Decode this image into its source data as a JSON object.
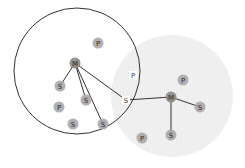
{
  "diagram": {
    "type": "network-topology",
    "colors": {
      "circle_outline": "#333333",
      "shaded_region": "#f2f2f2",
      "node_fill": "#a8a8a8",
      "master_fill": "#8a8a8a",
      "edge": "#333333"
    },
    "regions": [
      {
        "id": "left-piconet",
        "cx": 77,
        "cy": 71,
        "r": 63,
        "style": "outline"
      },
      {
        "id": "right-piconet",
        "cx": 172,
        "cy": 96,
        "r": 61,
        "style": "shaded"
      }
    ],
    "nodes": [
      {
        "id": "m1",
        "label": "M",
        "x": 75,
        "y": 63,
        "role": "master",
        "circle": true
      },
      {
        "id": "p1",
        "label": "P",
        "x": 98,
        "y": 43,
        "role": "parked",
        "circle": true
      },
      {
        "id": "s1",
        "label": "S",
        "x": 60,
        "y": 86,
        "role": "slave",
        "circle": true
      },
      {
        "id": "s2",
        "label": "S",
        "x": 86,
        "y": 100,
        "role": "slave",
        "circle": true
      },
      {
        "id": "p2",
        "label": "P",
        "x": 59,
        "y": 107,
        "role": "parked",
        "circle": true
      },
      {
        "id": "s3",
        "label": "S",
        "x": 73,
        "y": 124,
        "role": "slave",
        "circle": true
      },
      {
        "id": "s4",
        "label": "S",
        "x": 103,
        "y": 124,
        "role": "slave",
        "circle": true
      },
      {
        "id": "pb",
        "label": "P",
        "x": 133,
        "y": 75,
        "role": "parked",
        "circle": false
      },
      {
        "id": "sb",
        "label": "S",
        "x": 126,
        "y": 100,
        "role": "bridge-slave",
        "circle": false
      },
      {
        "id": "m2",
        "label": "M",
        "x": 171,
        "y": 97,
        "role": "master",
        "circle": true
      },
      {
        "id": "p3",
        "label": "P",
        "x": 183,
        "y": 80,
        "role": "parked",
        "circle": true
      },
      {
        "id": "s5",
        "label": "S",
        "x": 200,
        "y": 107,
        "role": "slave",
        "circle": true
      },
      {
        "id": "s6",
        "label": "S",
        "x": 171,
        "y": 135,
        "role": "slave",
        "circle": true
      },
      {
        "id": "p4",
        "label": "P",
        "x": 142,
        "y": 138,
        "role": "parked",
        "circle": true
      }
    ],
    "edges": [
      {
        "from": "m1",
        "to": "s1"
      },
      {
        "from": "m1",
        "to": "s2"
      },
      {
        "from": "m1",
        "to": "s4"
      },
      {
        "from": "m1",
        "to": "sb"
      },
      {
        "from": "sb",
        "to": "m2"
      },
      {
        "from": "m2",
        "to": "s5"
      },
      {
        "from": "m2",
        "to": "s6"
      }
    ]
  }
}
